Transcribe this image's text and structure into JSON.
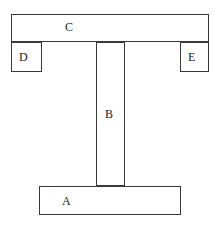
{
  "figure": {
    "kind": "cross-section-diagram",
    "background_color": "#ffffff",
    "line_color": "#3a3a3a",
    "text_color": "#1c1c1c",
    "width": 220,
    "height": 227
  },
  "regions": {
    "a": {
      "label": "A",
      "name": "bottom-flange",
      "x": 39,
      "y": 186,
      "width": 142,
      "height": 29
    },
    "b": {
      "label": "B",
      "name": "vertical-web",
      "x": 96,
      "y": 42,
      "width": 29,
      "height": 144
    },
    "c": {
      "label": "C",
      "name": "top-flange",
      "x": 11,
      "y": 14,
      "width": 198,
      "height": 28
    },
    "d": {
      "label": "D",
      "name": "left-lower-block",
      "x": 11,
      "y": 42,
      "width": 31,
      "height": 30
    },
    "e": {
      "label": "E",
      "name": "right-lower-block",
      "x": 180,
      "y": 42,
      "width": 29,
      "height": 30
    }
  }
}
